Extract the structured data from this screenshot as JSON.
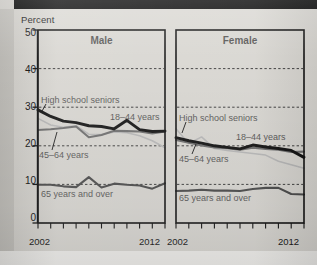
{
  "figure": {
    "unit_label": "Percent",
    "background_color": "#d9d7d2"
  },
  "panels": [
    {
      "key": "male",
      "title": "Male"
    },
    {
      "key": "female",
      "title": "Female"
    }
  ],
  "axis": {
    "y_ticks": [
      "0",
      "10",
      "20",
      "30",
      "40",
      "50"
    ],
    "y_values": [
      0,
      10,
      20,
      30,
      40,
      50
    ],
    "y_min": 0,
    "y_max": 50,
    "x_start_label": "2002",
    "x_end_label": "2012",
    "x_min": 2002,
    "x_max": 2012,
    "x_tick_count": 11,
    "gridlines": [
      10,
      20,
      30,
      40
    ]
  },
  "series_labels": {
    "high_school_seniors": "High school seniors",
    "age_18_44": "18–44 years",
    "age_45_64": "45–64 years",
    "age_65_over": "65 years and over"
  },
  "colors": {
    "line_18_44": "#111111",
    "line_45_64": "#6d6d6d",
    "line_high_school": "#b7b7b7",
    "line_65_over": "#4a4a4a",
    "panel_border": "#111111",
    "gridline": "#2b2b2b",
    "text": "#111111",
    "panel_fill": "#d7d5d0"
  },
  "chart_data": {
    "type": "line",
    "title": "",
    "subtitle": "",
    "xlabel": "",
    "ylabel": "Percent",
    "ylim": [
      0,
      50
    ],
    "xlim": [
      2002,
      2012
    ],
    "grid": true,
    "legend_position": "inline-annotation",
    "x": [
      2002,
      2003,
      2004,
      2005,
      2006,
      2007,
      2008,
      2009,
      2010,
      2011,
      2012
    ],
    "panels": [
      {
        "name": "Male",
        "series": [
          {
            "name": "High school seniors",
            "style": "thin-light-gray",
            "values": [
              27.1,
              25.4,
              24.8,
              25.2,
              23.0,
              22.9,
              23.6,
              23.4,
              22.6,
              21.3,
              19.5
            ]
          },
          {
            "name": "18–44 years",
            "style": "thick-black",
            "values": [
              29.3,
              27.6,
              26.4,
              26.0,
              25.2,
              25.0,
              24.4,
              26.6,
              24.2,
              23.7,
              23.8
            ]
          },
          {
            "name": "45–64 years",
            "style": "medium-gray",
            "values": [
              24.1,
              24.3,
              24.6,
              25.0,
              22.2,
              22.8,
              23.9,
              23.8,
              23.7,
              23.2,
              23.7
            ]
          },
          {
            "name": "65 years and over",
            "style": "dark-gray",
            "values": [
              9.9,
              9.9,
              9.5,
              9.3,
              11.9,
              9.2,
              10.2,
              9.9,
              9.7,
              8.9,
              10.3
            ]
          }
        ]
      },
      {
        "name": "Female",
        "series": [
          {
            "name": "High school seniors",
            "style": "thin-light-gray",
            "values": [
              24.4,
              20.6,
              22.3,
              19.3,
              18.8,
              18.4,
              18.0,
              17.6,
              16.0,
              15.1,
              14.2
            ]
          },
          {
            "name": "18–44 years",
            "style": "thick-black",
            "values": [
              22.1,
              21.3,
              20.7,
              20.0,
              19.6,
              19.2,
              20.2,
              19.7,
              19.3,
              18.8,
              17.0
            ]
          },
          {
            "name": "45–64 years",
            "style": "medium-gray",
            "values": [
              21.5,
              20.8,
              20.1,
              19.6,
              19.4,
              19.0,
              19.5,
              19.2,
              19.0,
              18.4,
              18.5
            ]
          },
          {
            "name": "65 years and over",
            "style": "dark-gray",
            "values": [
              8.3,
              8.4,
              8.6,
              8.4,
              8.4,
              8.3,
              8.8,
              9.1,
              9.1,
              7.5,
              7.4
            ]
          }
        ]
      }
    ]
  },
  "annotations": {
    "male": [
      {
        "key": "high_school_seniors",
        "text": "High school seniors"
      },
      {
        "key": "age_18_44",
        "text": "18–44 years"
      },
      {
        "key": "age_45_64",
        "text": "45–64 years"
      },
      {
        "key": "age_65_over",
        "text": "65 years and over"
      }
    ],
    "female": [
      {
        "key": "high_school_seniors",
        "text": "High school seniors"
      },
      {
        "key": "age_18_44",
        "text": "18–44 years"
      },
      {
        "key": "age_45_64",
        "text": "45–64 years"
      },
      {
        "key": "age_65_over",
        "text": "65 years and over"
      }
    ]
  }
}
